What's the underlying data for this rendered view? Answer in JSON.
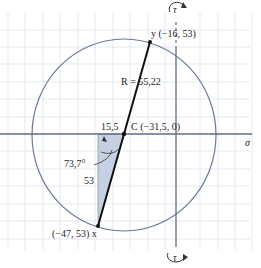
{
  "figure": {
    "type": "mohr-circle",
    "axes": {
      "horizontal_label": "σ",
      "vertical_label_top": "τ",
      "vertical_label_bottom": "τ"
    },
    "center": {
      "label": "C (−31,5, 0)",
      "sigma": -31.5,
      "tau": 0
    },
    "radius": {
      "label": "R = 55,22",
      "value": 55.22
    },
    "point_y": {
      "label": "y (−16, 53)",
      "sigma": -16,
      "tau": 53
    },
    "point_x": {
      "label": "(−47, 53) x",
      "sigma": -47,
      "tau": 53
    },
    "triangle": {
      "horizontal_leg_label": "15,5",
      "vertical_leg_label": "53",
      "angle_label": "73,7°"
    },
    "colors": {
      "circle": "#6b7a99",
      "axis": "#5d6a8a",
      "grid": "#dfe3ec",
      "diameter": "#111111",
      "triangle_fill": "#c5d0e3",
      "text": "#1e1e1e"
    }
  }
}
